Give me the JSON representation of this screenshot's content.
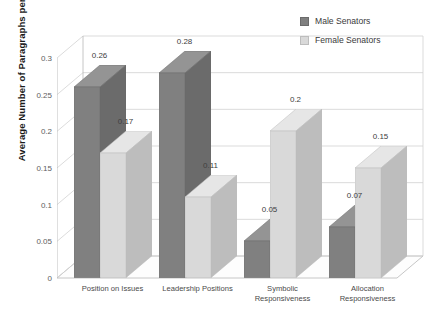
{
  "chart_data": {
    "type": "bar",
    "title": "",
    "xlabel": "",
    "ylabel": "Average Number of Paragraphs per Article",
    "ylim": [
      0,
      0.3
    ],
    "yticks": [
      "0",
      "0.05",
      "0.1",
      "0.15",
      "0.2",
      "0.25",
      "0.3"
    ],
    "ytick_values": [
      0,
      0.05,
      0.1,
      0.15,
      0.2,
      0.25,
      0.3
    ],
    "grid": true,
    "style_3d": true,
    "legend_position": "top-right",
    "categories": [
      "Position on Issues",
      "Leadership Positions",
      "Symbolic\nResponsiveness",
      "Allocation\nResponsiveness"
    ],
    "series": [
      {
        "name": "Male Senators",
        "color": "#808080",
        "values": [
          0.26,
          0.28,
          0.05,
          0.07
        ],
        "labels": [
          "0.26",
          "0.28",
          "0.05",
          "0.07"
        ]
      },
      {
        "name": "Female Senators",
        "color": "#d9d9d9",
        "values": [
          0.17,
          0.11,
          0.2,
          0.15
        ],
        "labels": [
          "0.17",
          "0.11",
          "0.2",
          "0.15"
        ]
      }
    ]
  },
  "legend": {
    "items": [
      {
        "label": "Male Senators",
        "color": "#808080"
      },
      {
        "label": "Female Senators",
        "color": "#d9d9d9"
      }
    ]
  },
  "colors": {
    "male_front": "#808080",
    "male_side": "#6b6b6b",
    "male_top": "#949494",
    "female_front": "#d9d9d9",
    "female_side": "#bdbdbd",
    "female_top": "#e6e6e6",
    "grid": "#d2d2d2",
    "axis": "#b8b8b8",
    "text": "#404040"
  }
}
